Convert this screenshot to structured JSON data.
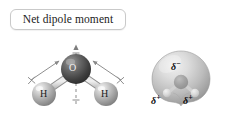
{
  "figure": {
    "background_color": "#ffffff",
    "width": 225,
    "height": 116
  },
  "callout": {
    "text": "Net dipole moment",
    "border_color": "#c9c9c9",
    "fill_color": "#ffffff"
  },
  "ball_and_stick": {
    "oxygen": {
      "label": "O",
      "color": "#4a4a4a"
    },
    "hydrogen_left": {
      "label": "H",
      "color": "#b5b5b5"
    },
    "hydrogen_right": {
      "label": "H",
      "color": "#b5b5b5"
    },
    "bond_dipole_left": {
      "name": "bond-dipole-arrow-left"
    },
    "bond_dipole_right": {
      "name": "bond-dipole-arrow-right"
    },
    "net_dipole": {
      "name": "net-dipole-arrow",
      "style": "dashed-vertical-up"
    }
  },
  "potential_surface": {
    "name": "electrostatic-potential-surface",
    "shape": "rounded-trefoil",
    "delta_negative": "δ",
    "delta_negative_sign": "−",
    "delta_positive_left": "δ",
    "delta_positive_left_sign": "+",
    "delta_positive_right": "δ",
    "delta_positive_right_sign": "+",
    "surface_color_light": "#e6e6e6",
    "surface_color_dark": "#8d8d8d"
  }
}
